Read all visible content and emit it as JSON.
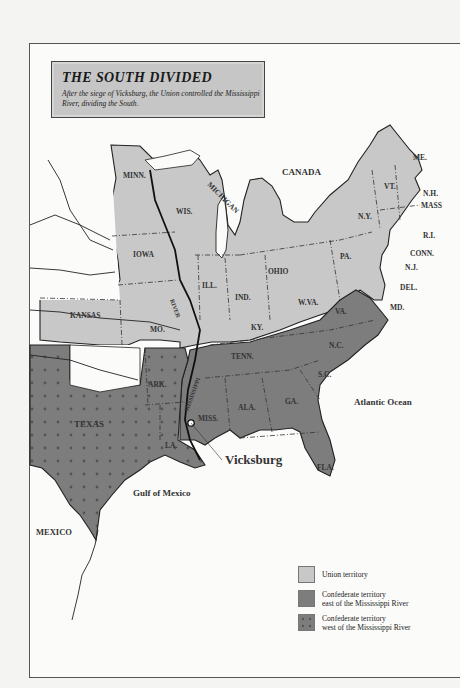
{
  "title": {
    "heading": "THE SOUTH DIVIDED",
    "subtitle": "After the siege of Vicksburg, the Union controlled the Mississippi River, dividing the South."
  },
  "colors": {
    "union": "#c8c8c8",
    "confederate_east": "#7d7d7d",
    "confederate_west": "#7d7d7d",
    "water": "#fbfbfa",
    "border": "#1e1e1e"
  },
  "labels": {
    "canada": "CANADA",
    "mexico": "MEXICO",
    "atlantic": "Atlantic Ocean",
    "gulf": "Gulf of Mexico",
    "vicksburg": "Vicksburg",
    "mississippi_river_north": "RIVER",
    "mississippi_river_south": "MISSISSIPPI",
    "michigan": "MICHIGAN"
  },
  "states": {
    "union": [
      "MINN.",
      "WIS.",
      "IOWA",
      "ILL.",
      "IND.",
      "OHIO",
      "PA.",
      "N.Y.",
      "VT.",
      "ME.",
      "N.H.",
      "MASS",
      "R.I.",
      "CONN.",
      "N.J.",
      "DEL.",
      "MD.",
      "W.VA.",
      "KY.",
      "MO.",
      "KANSAS"
    ],
    "confederate_east": [
      "VA.",
      "N.C.",
      "S.C.",
      "GA.",
      "FLA.",
      "ALA.",
      "MISS.",
      "TENN."
    ],
    "confederate_west": [
      "TEXAS",
      "ARK.",
      "LA."
    ]
  },
  "legend": {
    "items": [
      {
        "label_line1": "Union territory",
        "label_line2": "",
        "pattern": "solid-light"
      },
      {
        "label_line1": "Confederate territory",
        "label_line2": "east of the Mississippi River",
        "pattern": "solid-dark"
      },
      {
        "label_line1": "Confederate territory",
        "label_line2": "west of the Mississippi River",
        "pattern": "dotted-dark"
      }
    ]
  }
}
